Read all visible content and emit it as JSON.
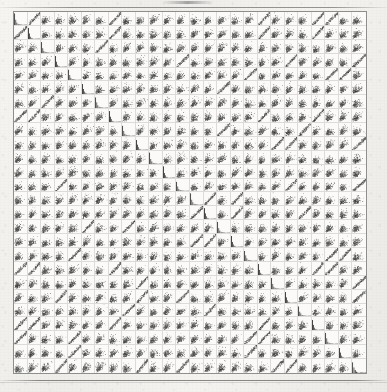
{
  "page": {
    "background_color": "#f2f1ee",
    "paper_tone": "scanned-photocopy off-white",
    "rule_top_label": "horizontal-rule",
    "rule_bottom_label": "horizontal-rule",
    "caption_remnant_label": "cropped-caption-smudge"
  },
  "figure": {
    "type": "scatterplot-matrix",
    "title": "",
    "frame_color": "#464646",
    "cell_border_color": "#969696",
    "plot_background": "#fbfaf8",
    "ink_color": "#1a1a1a",
    "n_variables": 26,
    "rows": 26,
    "cols": 26,
    "diagonal_content": "histogram",
    "offdiagonal_content": "scatter",
    "axis_labels_visible": false,
    "tick_labels_visible": false,
    "variable_labels": []
  },
  "chart_data": {
    "type": "scatter",
    "title": "",
    "xlabel": "",
    "ylabel": "",
    "layout": "matrix",
    "rows": 26,
    "cols": 26,
    "grid": true,
    "legend": "none",
    "diagonal": "histogram",
    "xlim": [
      0,
      1
    ],
    "ylim": [
      0,
      1
    ],
    "panel_summary": [
      {
        "kind": "histogram",
        "shape": "right-skewed",
        "peak_position": 0.08,
        "count": 26
      },
      {
        "kind": "scatter-blob",
        "correlation": 0.15,
        "density": "high",
        "anchor": "lower-left"
      },
      {
        "kind": "scatter-streak",
        "correlation": 0.92,
        "density": "high",
        "anchor": "diagonal"
      }
    ],
    "series": [
      {
        "name": "panel-points",
        "values": []
      }
    ]
  }
}
